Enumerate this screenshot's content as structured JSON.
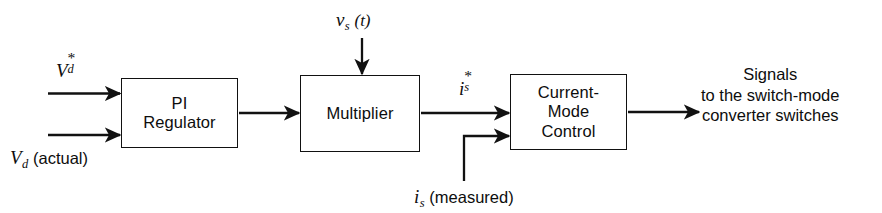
{
  "figure": {
    "kind": "block-diagram",
    "title_visible": "",
    "background_color": "#ffffff",
    "line_color": "#111111",
    "text_color": "#0d0d0d"
  },
  "blocks": [
    {
      "id": "pi-regulator",
      "label_lines": [
        "PI",
        "Regulator"
      ],
      "x": 121,
      "y": 78,
      "w": 117,
      "h": 70
    },
    {
      "id": "multiplier",
      "label_lines": [
        "Multiplier"
      ],
      "x": 300,
      "y": 75,
      "w": 120,
      "h": 77
    },
    {
      "id": "current-mode-control",
      "label_lines": [
        "Current-",
        "Mode",
        "Control"
      ],
      "x": 510,
      "y": 74,
      "w": 117,
      "h": 76
    }
  ],
  "labels": {
    "vd_reference": {
      "base": "V",
      "sub": "d",
      "sup": "*",
      "suffix": ""
    },
    "vd_actual": {
      "base": "V",
      "sub": "d",
      "sup": "",
      "suffix": "(actual)"
    },
    "vs_t": {
      "base": "v",
      "sub": "s",
      "sup": "",
      "suffix": "(t)"
    },
    "is_reference": {
      "base": "i",
      "sub": "s",
      "sup": "*",
      "suffix": ""
    },
    "is_measured": {
      "base": "i",
      "sub": "s",
      "sup": "",
      "suffix": "(measured)"
    }
  },
  "output": {
    "lines": [
      "Signals",
      "to the switch-mode",
      "converter switches"
    ]
  },
  "signals": [
    {
      "name": "vd-reference-input",
      "from": "left-edge",
      "to": "pi-regulator",
      "orientation": "horizontal"
    },
    {
      "name": "vd-actual-input",
      "from": "left-edge",
      "to": "pi-regulator",
      "orientation": "horizontal"
    },
    {
      "name": "pi-to-multiplier",
      "from": "pi-regulator",
      "to": "multiplier",
      "orientation": "horizontal"
    },
    {
      "name": "vs-to-multiplier",
      "from": "top",
      "to": "multiplier",
      "orientation": "vertical"
    },
    {
      "name": "multiplier-to-current-mode",
      "from": "multiplier",
      "to": "current-mode-control",
      "orientation": "horizontal"
    },
    {
      "name": "is-measured-feedback",
      "from": "bottom",
      "to": "current-mode-control",
      "orientation": "elbow"
    },
    {
      "name": "current-mode-output",
      "from": "current-mode-control",
      "to": "output-text",
      "orientation": "horizontal"
    }
  ]
}
